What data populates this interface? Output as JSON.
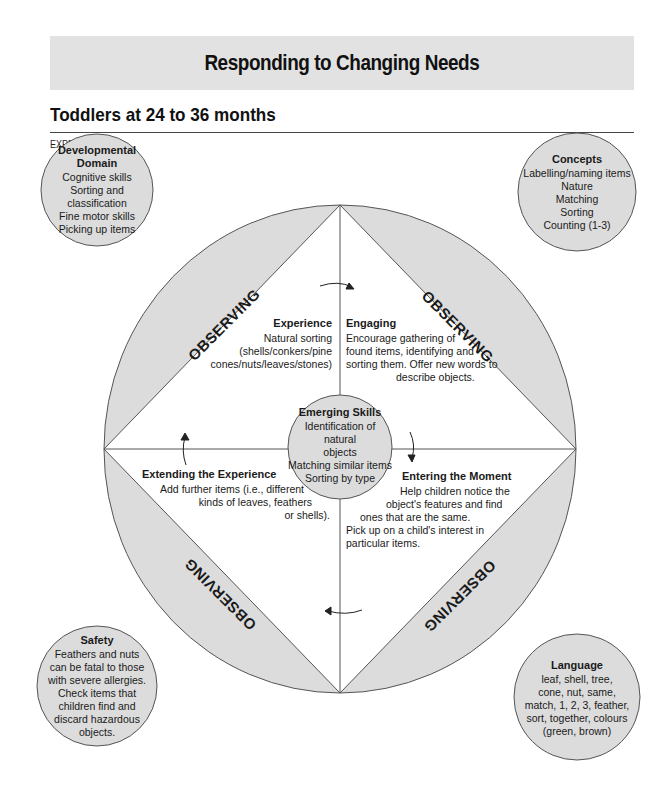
{
  "header": {
    "banner_title": "Responding to Changing Needs",
    "subtitle": "Toddlers at 24 to 36 months",
    "experience_label": "EXPERIENCE 1"
  },
  "colors": {
    "banner_bg": "#e2e2e2",
    "segment_fill": "#dcdcdc",
    "outline": "#555555",
    "text": "#1a1a1a"
  },
  "corners": {
    "developmental_domain": {
      "title": "Developmental Domain",
      "lines": [
        "Cognitive skills",
        "Sorting and",
        "classification",
        "Fine motor skills",
        "Picking up items"
      ]
    },
    "concepts": {
      "title": "Concepts",
      "lines": [
        "Labelling/naming items",
        "Nature",
        "Matching",
        "Sorting",
        "Counting (1-3)"
      ]
    },
    "safety": {
      "title": "Safety",
      "lines": [
        "Feathers and nuts",
        "can be fatal to those",
        "with severe allergies.",
        "Check items that",
        "children find and",
        "discard hazardous",
        "objects."
      ]
    },
    "language": {
      "title": "Language",
      "lines": [
        "leaf, shell, tree,",
        "cone, nut, same,",
        "match, 1, 2, 3, feather,",
        "sort, together, colours",
        "(green, brown)"
      ]
    }
  },
  "observing_labels": [
    "OBSERVING",
    "OBSERVING",
    "OBSERVING",
    "OBSERVING"
  ],
  "quadrants": {
    "experience": {
      "title": "Experience",
      "lines": [
        "Natural sorting",
        "(shells/conkers/pine",
        "cones/nuts/leaves/stones)"
      ]
    },
    "engaging": {
      "title": "Engaging",
      "lines": [
        "Encourage gathering of",
        "found items, identifying and",
        "sorting them. Offer new words to",
        "describe objects."
      ]
    },
    "extending": {
      "title": "Extending the Experience",
      "lines": [
        "Add further items (i.e., different",
        "kinds of leaves, feathers",
        "or shells)."
      ]
    },
    "entering": {
      "title": "Entering the Moment",
      "lines": [
        "Help children notice the",
        "object's features and find",
        "ones that are the same.",
        "Pick up on a child's interest in",
        "particular items."
      ]
    }
  },
  "center": {
    "title": "Emerging Skills",
    "lines": [
      "Identification of natural",
      "objects",
      "Matching similar items",
      "Sorting by type"
    ]
  }
}
